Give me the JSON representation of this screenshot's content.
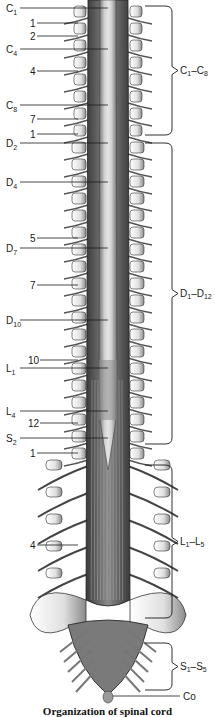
{
  "figure": {
    "caption": "Organization of spinal cord",
    "left_labels": [
      {
        "main": "C",
        "sub": "1",
        "y": 8
      },
      {
        "main": "1",
        "sub": "",
        "y": 23
      },
      {
        "main": "2",
        "sub": "",
        "y": 36
      },
      {
        "main": "C",
        "sub": "4",
        "y": 49
      },
      {
        "main": "4",
        "sub": "",
        "y": 71
      },
      {
        "main": "C",
        "sub": "8",
        "y": 105
      },
      {
        "main": "7",
        "sub": "",
        "y": 119
      },
      {
        "main": "1",
        "sub": "",
        "y": 134
      },
      {
        "main": "D",
        "sub": "2",
        "y": 143
      },
      {
        "main": "D",
        "sub": "4",
        "y": 182
      },
      {
        "main": "5",
        "sub": "",
        "y": 238
      },
      {
        "main": "D",
        "sub": "7",
        "y": 248
      },
      {
        "main": "7",
        "sub": "",
        "y": 285
      },
      {
        "main": "D",
        "sub": "10",
        "y": 320
      },
      {
        "main": "10",
        "sub": "",
        "y": 360
      },
      {
        "main": "L",
        "sub": "1",
        "y": 368
      },
      {
        "main": "L",
        "sub": "4",
        "y": 411
      },
      {
        "main": "12",
        "sub": "",
        "y": 423
      },
      {
        "main": "S",
        "sub": "2",
        "y": 438
      },
      {
        "main": "1",
        "sub": "",
        "y": 453
      },
      {
        "main": "4",
        "sub": "",
        "y": 545
      }
    ],
    "right_groups": [
      {
        "label": "C1–C8",
        "main1": "C",
        "sub1": "1",
        "main2": "C",
        "sub2": "8",
        "top": 6,
        "bottom": 135
      },
      {
        "label": "D1–D12",
        "main1": "D",
        "sub1": "1",
        "main2": "D",
        "sub2": "12",
        "top": 143,
        "bottom": 444
      },
      {
        "label": "L1–L5",
        "main1": "L",
        "sub1": "1",
        "main2": "L",
        "sub2": "5",
        "top": 465,
        "bottom": 618
      },
      {
        "label": "S1–S5",
        "main1": "S",
        "sub1": "1",
        "main2": "S",
        "sub2": "5",
        "top": 643,
        "bottom": 690
      },
      {
        "label": "Co",
        "main1": "Co",
        "y": 696
      }
    ],
    "colors": {
      "ink": "#1a1a1a",
      "bone": "#e8e8e8",
      "cord": "#bcbcbc",
      "nerve": "#6a6a6a"
    }
  }
}
